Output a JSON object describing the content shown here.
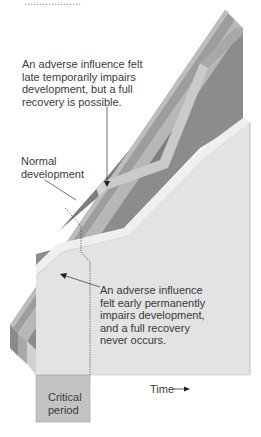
{
  "figure": {
    "top_cut_text": "...................",
    "labels": {
      "late_influence": "An adverse influence felt\nlate temporarily impairs\ndevelopment, but a full\nrecovery is possible.",
      "normal_development": "Normal\ndevelopment",
      "early_influence": "An adverse influence\nfelt early permanently\nimpairs development,\nand a full recovery\nnever occurs.",
      "critical_period": "Critical\nperiod",
      "time_axis": "Time"
    },
    "colors": {
      "outer_band": "#9a9a9a",
      "outer_band_top": "#c4c4c4",
      "inner_band": "#b9b9b9",
      "dark_face": "#8c8c8c",
      "dark_face_shadow": "#7d7d7d",
      "late_path": "#c9c9c9",
      "light_face": "#e4e4e4",
      "light_face_edge": "#f0f0f0",
      "side_dark": "#8a8a8a",
      "side_mid": "#b5b5b5",
      "critical_box": "#c2c2c2"
    }
  }
}
